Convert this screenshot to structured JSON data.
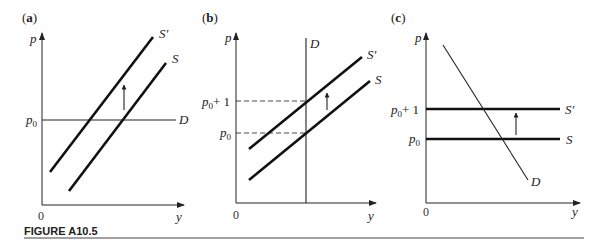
{
  "figure": {
    "caption": "FIGURE A10.5",
    "panels": [
      {
        "id": "a",
        "label_open": "(",
        "label_letter": "a",
        "label_close": ")",
        "y_axis_label": "p",
        "x_axis_label": "y",
        "origin_label": "0",
        "price_labels": [
          "p0"
        ],
        "curves": {
          "supply": "S",
          "supply_shifted": "S′",
          "demand": "D"
        }
      },
      {
        "id": "b",
        "label_open": "(",
        "label_letter": "b",
        "label_close": ")",
        "y_axis_label": "p",
        "x_axis_label": "y",
        "origin_label": "0",
        "price_labels": [
          "p0",
          "p0 + 1"
        ],
        "curves": {
          "supply": "S",
          "supply_shifted": "S′",
          "demand": "D"
        }
      },
      {
        "id": "c",
        "label_open": "(",
        "label_letter": "c",
        "label_close": ")",
        "y_axis_label": "p",
        "x_axis_label": "y",
        "origin_label": "0",
        "price_labels": [
          "p0",
          "p0 + 1"
        ],
        "curves": {
          "supply": "S",
          "supply_shifted": "S′",
          "demand": "D"
        }
      }
    ],
    "text": {
      "p": "p",
      "y": "y",
      "zero": "0",
      "p0_base": "p",
      "p0_sub": "0",
      "plus_one": "+ 1",
      "S": "S",
      "S_prime": "S′",
      "D": "D",
      "a": "a",
      "b": "b",
      "c": "c",
      "paren_open": "(",
      "paren_close": ")"
    }
  }
}
